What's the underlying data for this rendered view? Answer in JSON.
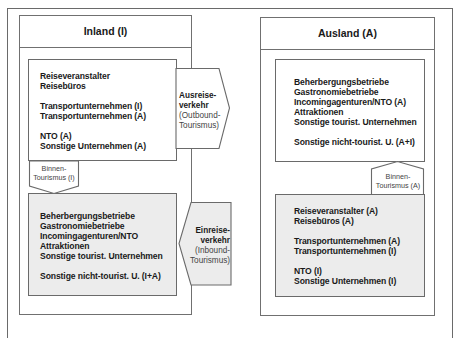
{
  "inland": {
    "title": "Inland (I)",
    "outbound_suppliers": [
      "Reiseveranstalter",
      "Reisebüros",
      "",
      "Transportunternehmen (I)",
      "Transportunternehmen (A)",
      "",
      "NTO (A)",
      "Sonstige Unternehmen (A)"
    ],
    "inbound_suppliers": [
      "Beherbergungsbetriebe",
      "Gastronomiebetriebe",
      "Incomingagenturen/NTO",
      "Attraktionen",
      "Sonstige tourist. Unternehmen",
      "",
      "Sonstige nicht-tourist. U. (I+A)"
    ],
    "domestic_arrow": {
      "line1": "Binnen-",
      "line2": "Tourismus (I)"
    }
  },
  "ausland": {
    "title": "Ausland (A)",
    "receiving_suppliers": [
      "Beherbergungsbetriebe",
      "Gastronomiebetriebe",
      "Incomingagenturen/NTO (A)",
      "Attraktionen",
      "Sonstige tourist. Unternehmen",
      "",
      "Sonstige nicht-tourist. U. (A+I)"
    ],
    "sending_suppliers": [
      "Reiseveranstalter (A)",
      "Reisebüros (A)",
      "",
      "Transportunternehmen (A)",
      "Transportunternehmen (I)",
      "",
      "NTO (I)",
      "Sonstige Unternehmen (I)"
    ],
    "domestic_arrow": {
      "line1": "Binnen-",
      "line2": "Tourismus (A)"
    }
  },
  "flows": {
    "outbound": {
      "line1": "Ausreise-",
      "line2": "verkehr",
      "line3": "(Outbound-",
      "line4": "Tourismus)"
    },
    "inbound": {
      "line1": "Einreise-",
      "line2": "verkehr",
      "line3": "(Inbound-",
      "line4": "Tourismus)"
    }
  },
  "colors": {
    "gray_fill": "#ececec",
    "border": "#6a6a6a"
  }
}
